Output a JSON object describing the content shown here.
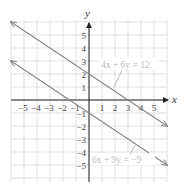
{
  "chart_data": {
    "type": "line",
    "title": "",
    "xlabel": "x",
    "ylabel": "y",
    "xlim": [
      -6,
      6
    ],
    "ylim": [
      -6,
      6
    ],
    "grid": true,
    "x_ticks": [
      -5,
      -4,
      -3,
      -2,
      -1,
      1,
      2,
      3,
      4,
      5
    ],
    "y_ticks": [
      5,
      4,
      3,
      2,
      1,
      -1,
      -2,
      -3,
      -4,
      -5
    ],
    "x_tick_labels": [
      "−5",
      "−4",
      "−3",
      "−2",
      "−1",
      "1",
      "2",
      "3",
      "4",
      "5"
    ],
    "y_tick_labels": [
      "5",
      "4",
      "3",
      "2",
      "1",
      "−1",
      "−2",
      "−3",
      "−4",
      "−5"
    ],
    "series": [
      {
        "name": "4x + 6y = 12",
        "slope": -0.6667,
        "intercept": 2,
        "points": [
          [
            -6,
            6
          ],
          [
            0,
            2
          ],
          [
            3,
            0
          ],
          [
            6,
            -2
          ]
        ],
        "color": "#888888",
        "label_position": [
          1.1,
          5.0
        ]
      },
      {
        "name": "6x + 9y = −9",
        "slope": -0.6667,
        "intercept": -1,
        "points": [
          [
            -6,
            3
          ],
          [
            -1.5,
            0
          ],
          [
            0,
            -1
          ],
          [
            6,
            -5
          ]
        ],
        "color": "#888888",
        "label_position": [
          0.2,
          -4.5
        ]
      }
    ],
    "annotations": [
      {
        "text": "4x + 6y = 12",
        "arrow_to": [
          2.2,
          0.6
        ]
      },
      {
        "text": "6x + 9y = −9",
        "arrow_to": [
          3.6,
          -3.4
        ]
      }
    ]
  },
  "labels": {
    "x_axis": "x",
    "y_axis": "y",
    "eq1": "4x + 6y = 12",
    "eq2": "6x + 9y = −9",
    "xt": [
      "−5",
      "−4",
      "−3",
      "−2",
      "−1",
      "1",
      "2",
      "3",
      "4",
      "5"
    ],
    "yt": [
      "5",
      "4",
      "3",
      "2",
      "1",
      "−1",
      "−2",
      "−3",
      "−4",
      "−5"
    ]
  },
  "colors": {
    "grid": "#e2e2e2",
    "axis": "#222222",
    "line": "#8a8a8a",
    "label": "#bbbbbb"
  }
}
